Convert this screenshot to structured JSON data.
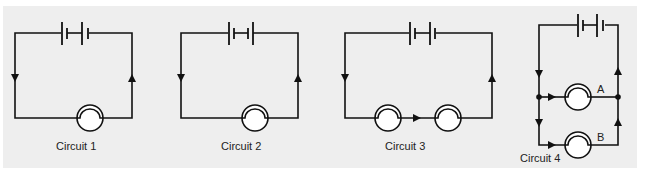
{
  "diagram": {
    "type": "electric circuit diagrams",
    "colors": {
      "background": "#eeeeee",
      "line": "#111111",
      "bulb_fill": "#ffffff"
    },
    "circuits": [
      {
        "id": 1,
        "label": "Circuit 1",
        "cells": 2,
        "bulbs": 1,
        "arrangement": "single bulb"
      },
      {
        "id": 2,
        "label": "Circuit 2",
        "cells": 2,
        "bulbs": 1,
        "arrangement": "single bulb",
        "note": "cells connected with opposing orientation"
      },
      {
        "id": 3,
        "label": "Circuit 3",
        "cells": 2,
        "bulbs": 2,
        "arrangement": "series"
      },
      {
        "id": 4,
        "label": "Circuit 4",
        "cells": 2,
        "bulbs": 2,
        "arrangement": "parallel",
        "bulb_labels": [
          "A",
          "B"
        ]
      }
    ]
  }
}
